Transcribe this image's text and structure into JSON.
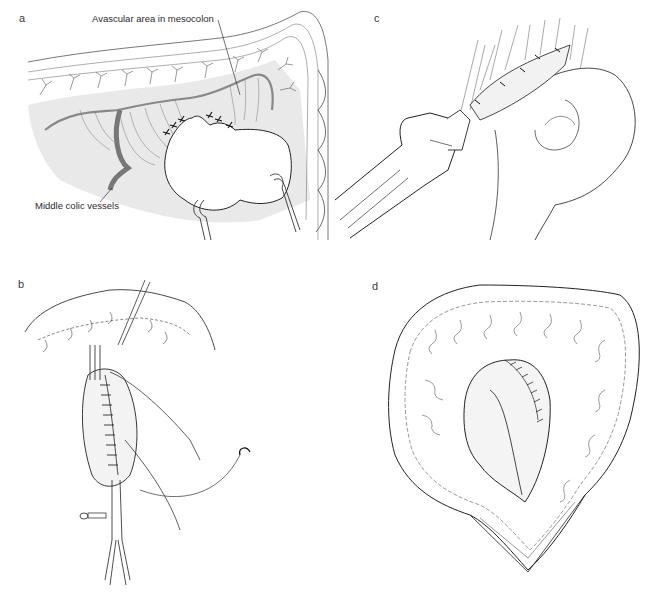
{
  "figure": {
    "panels": [
      {
        "id": "a",
        "letter": "a",
        "labels": {
          "avascular_area": "Avascular area in mesocolon",
          "stomach": "Stomach",
          "middle_colic_vessels": "Middle colic vessels"
        }
      },
      {
        "id": "b",
        "letter": "b"
      },
      {
        "id": "c",
        "letter": "c"
      },
      {
        "id": "d",
        "letter": "d"
      }
    ]
  },
  "colors": {
    "line": "#2a2a2a",
    "shade": "#e6e6e6",
    "vessel": "#8a8a8a",
    "background": "#ffffff"
  }
}
